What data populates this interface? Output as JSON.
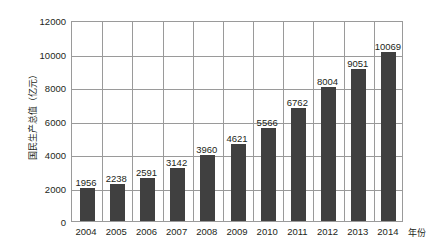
{
  "chart_data": {
    "type": "bar",
    "title": "",
    "xlabel": "年份",
    "ylabel": "国民生产总值（亿元）",
    "categories": [
      "2004",
      "2005",
      "2006",
      "2007",
      "2008",
      "2009",
      "2010",
      "2011",
      "2012",
      "2013",
      "2014"
    ],
    "values": [
      1956,
      2238,
      2591,
      3142,
      3960,
      4621,
      5566,
      6762,
      8004,
      9051,
      10069
    ],
    "data_labels": [
      "1956",
      "2238",
      "2591",
      "3142",
      "3960",
      "4621",
      "5566",
      "6762",
      "8004",
      "9051",
      "10069"
    ],
    "ylim": [
      0,
      12000
    ],
    "ytick_labels": [
      "0",
      "2000",
      "4000",
      "6000",
      "8000",
      "10000",
      "12000"
    ],
    "ytick_values": [
      0,
      2000,
      4000,
      6000,
      8000,
      10000,
      12000
    ],
    "ystep": 2000,
    "grid": "both",
    "legend": "none",
    "series_name": "国民生产总值",
    "bar_color": "#404040",
    "grid_color": "#9a9a9a",
    "text_color": "#231f20",
    "background_color": "#ffffff"
  }
}
